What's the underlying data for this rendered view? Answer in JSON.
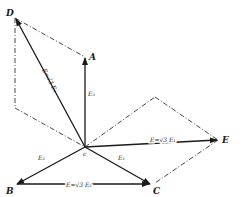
{
  "diagram": {
    "points": {
      "D": "D",
      "A": "A",
      "E": "E",
      "B": "B",
      "C": "C",
      "origin": "c"
    },
    "vector_labels": {
      "E3": "E₃",
      "E2": "E₂",
      "E1": "E₁",
      "ED": "E=√3 E₃",
      "EE": "E=√3 E₁",
      "EBC": "E=√3 E₂"
    },
    "colors": {
      "ink": "#1a1a1a",
      "background": "#ffffff"
    }
  }
}
